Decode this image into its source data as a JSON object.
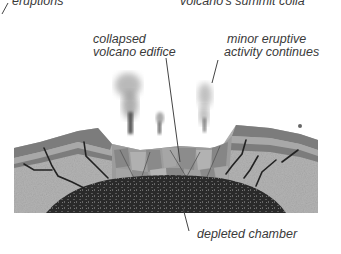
{
  "labels": {
    "top_left": "eruptions",
    "top_right": "volcano's summit colla",
    "collapsed_line1": "collapsed",
    "collapsed_line2": "volcano edifice",
    "minor_line1": "minor eruptive",
    "minor_line2": "activity continues",
    "chamber": "depleted chamber"
  },
  "colors": {
    "ground": "#b4b4b4",
    "strata_dark": "#7c7c7c",
    "strata_light": "#a8a8a8",
    "chamber": "#2e2e2e",
    "smoke": "#9a9a9a",
    "text": "#3a3a3a"
  }
}
